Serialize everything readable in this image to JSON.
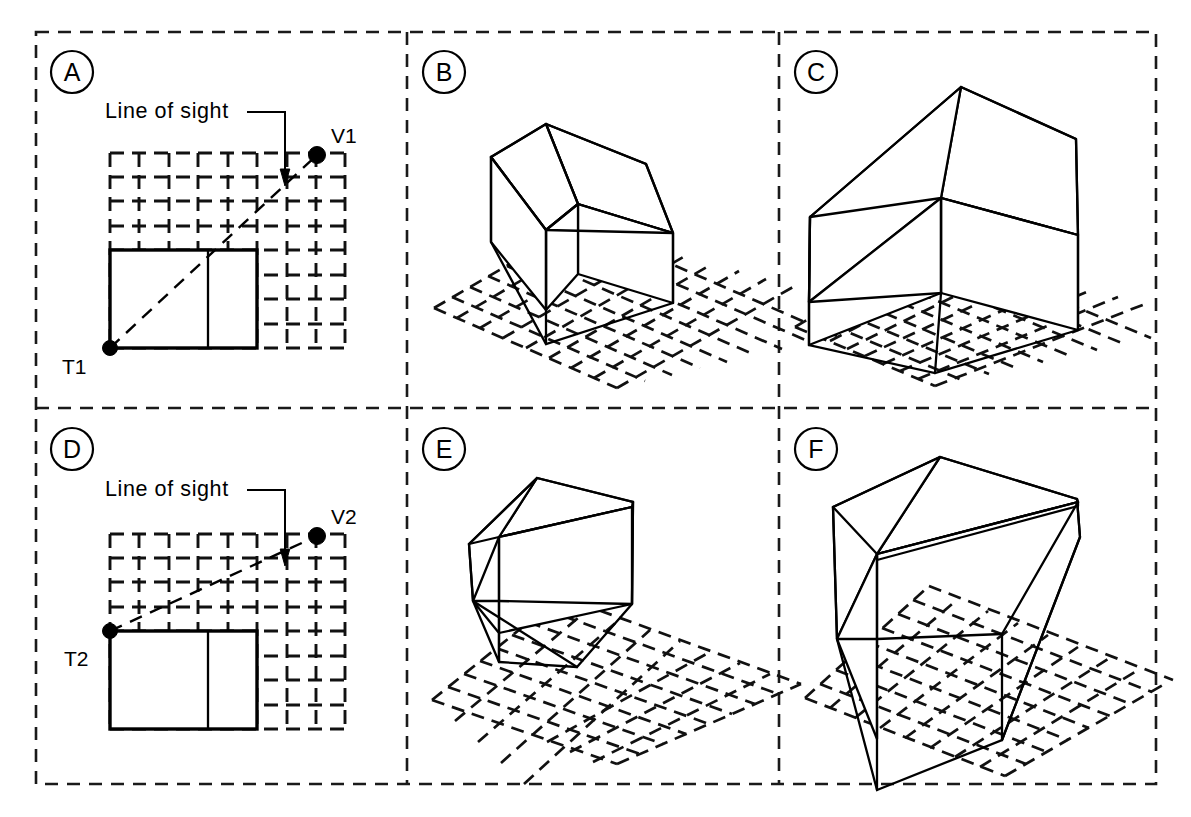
{
  "figure": {
    "type": "technical-diagram",
    "panel_rows": 2,
    "panel_cols": 3,
    "line_color": "#000000",
    "background_color": "#ffffff"
  },
  "panels": [
    {
      "id": "A",
      "letter": "A",
      "kind": "plan",
      "row": 0,
      "col": 0,
      "annotation": "Line of sight",
      "target_label": "T1",
      "viewpoint_label": "V1",
      "grid_cols": 8,
      "grid_rows": 8,
      "target_origin": "bottom-left",
      "sight_slope": "steep"
    },
    {
      "id": "B",
      "letter": "B",
      "kind": "perspective",
      "row": 0,
      "col": 1,
      "view_of": "A",
      "notes": "High oblique view from V1; box sits on dashed ground grid"
    },
    {
      "id": "C",
      "letter": "C",
      "kind": "perspective",
      "row": 0,
      "col": 2,
      "view_of": "A",
      "notes": "Closer high oblique view; larger box"
    },
    {
      "id": "D",
      "letter": "D",
      "kind": "plan",
      "row": 1,
      "col": 0,
      "annotation": "Line of sight",
      "target_label": "T2",
      "viewpoint_label": "V2",
      "grid_cols": 8,
      "grid_rows": 8,
      "target_origin": "top-left",
      "sight_slope": "shallow"
    },
    {
      "id": "E",
      "letter": "E",
      "kind": "perspective",
      "row": 1,
      "col": 1,
      "view_of": "D",
      "notes": "Lower viewing angle; more of the vertical face visible"
    },
    {
      "id": "F",
      "letter": "F",
      "kind": "perspective",
      "row": 1,
      "col": 2,
      "view_of": "D",
      "notes": "Closest and lowest viewing angle; tallest apparent face"
    }
  ],
  "icons": {
    "target_point": "filled-dot-marker",
    "viewpoint": "filled-dot-marker",
    "leader": "leader-arrow"
  }
}
